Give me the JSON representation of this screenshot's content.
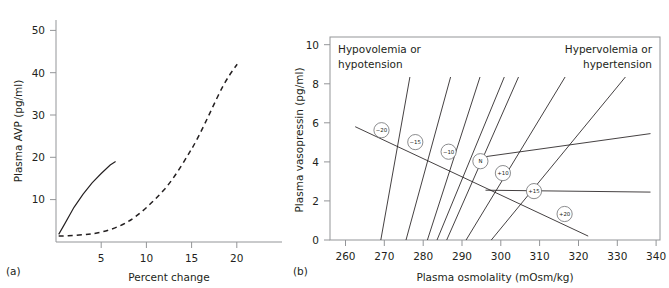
{
  "figure": {
    "panels": [
      {
        "id": "a",
        "label": "(a)",
        "axes": {
          "x": {
            "title": "Percent change",
            "ticks": [
              5,
              10,
              15,
              20
            ],
            "min": 0,
            "max": 25
          },
          "y": {
            "title": "Plasma AVP (pg/ml)",
            "ticks": [
              10,
              20,
              30,
              40,
              50
            ],
            "min": 0,
            "max": 55
          }
        }
      },
      {
        "id": "b",
        "label": "(b)",
        "axes": {
          "x": {
            "title": "Plasma osmolality (mOsm/kg)",
            "ticks": [
              260,
              270,
              280,
              290,
              300,
              310,
              320,
              330,
              340
            ],
            "min": 256,
            "max": 341
          },
          "y": {
            "title": "Plasma vasopressin (pg/ml)",
            "ticks": [
              0,
              2,
              4,
              6,
              8,
              10
            ],
            "min": 0,
            "max": 10.4
          }
        },
        "annotations": {
          "top_left": "Hypovolemia or hypotension",
          "top_right": "Hypervolemia or hypertension"
        }
      }
    ]
  },
  "chart_data": [
    {
      "type": "line",
      "panel": "a",
      "title": "",
      "xlabel": "Percent change",
      "ylabel": "Plasma AVP (pg/ml)",
      "xlim": [
        0,
        25
      ],
      "ylim": [
        0,
        55
      ],
      "xticks": [
        5,
        10,
        15,
        20
      ],
      "yticks": [
        10,
        20,
        30,
        40,
        50
      ],
      "grid": false,
      "legend": "none",
      "series": [
        {
          "name": "Osmolality (solid)",
          "style": "solid",
          "x": [
            0.3,
            1.0,
            2.0,
            3.0,
            4.0,
            5.0,
            6.0,
            6.6
          ],
          "y": [
            1.8,
            4.4,
            8.2,
            11.3,
            14.0,
            16.2,
            18.2,
            19.0
          ]
        },
        {
          "name": "Volume / pressure (dashed)",
          "style": "dashed",
          "x": [
            0.3,
            2.0,
            4.0,
            6.0,
            8.0,
            10.0,
            12.0,
            14.0,
            15.0,
            16.0,
            17.0,
            18.0,
            19.0,
            19.5
          ],
          "y": [
            1.4,
            1.5,
            1.8,
            2.3,
            3.2,
            4.6,
            6.5,
            9.5,
            11.8,
            14.8,
            19.5,
            26.5,
            36.0,
            42.0
          ]
        }
      ]
    },
    {
      "type": "line",
      "panel": "b",
      "title": "",
      "xlabel": "Plasma osmolality (mOsm/kg)",
      "ylabel": "Plasma vasopressin (pg/ml)",
      "xlim": [
        256,
        341
      ],
      "ylim": [
        0,
        10.4
      ],
      "xticks": [
        260,
        270,
        280,
        290,
        300,
        310,
        320,
        330,
        340
      ],
      "yticks": [
        0,
        2,
        4,
        6,
        8,
        10
      ],
      "grid": false,
      "legend": "none",
      "annotations": [
        {
          "text": "Hypovolemia or hypotension",
          "x": 262,
          "y": 9.7,
          "align": "left"
        },
        {
          "text": "Hypervolemia or hypertension",
          "x": 339,
          "y": 9.7,
          "align": "right"
        }
      ],
      "nodes": [
        {
          "label": "−20",
          "x": 269.3,
          "y": 5.62
        },
        {
          "label": "−15",
          "x": 278.0,
          "y": 5.01
        },
        {
          "label": "−10",
          "x": 286.6,
          "y": 4.52
        },
        {
          "label": "N",
          "x": 294.8,
          "y": 4.03
        },
        {
          "label": "+10",
          "x": 300.6,
          "y": 3.42
        },
        {
          "label": "+15",
          "x": 308.6,
          "y": 2.5
        },
        {
          "label": "+20",
          "x": 316.5,
          "y": 1.33
        }
      ],
      "isopleths": [
        {
          "name": "-20",
          "x": [
            265.0,
            272.5
          ],
          "y": [
            0.0,
            8.35
          ]
        },
        {
          "name": "-15",
          "x": [
            271.5,
            283.0
          ],
          "y": [
            0.0,
            8.35
          ]
        },
        {
          "name": "-10",
          "x": [
            277.0,
            290.5
          ],
          "y": [
            0.0,
            8.35
          ]
        },
        {
          "name": "N",
          "x": [
            279.5,
            296.8
          ],
          "y": [
            0.0,
            8.35
          ]
        },
        {
          "name": "+10",
          "x": [
            282.0,
            300.5
          ],
          "y": [
            0.0,
            8.35
          ]
        },
        {
          "name": "+15",
          "x": [
            287.0,
            312.5
          ],
          "y": [
            0.0,
            8.35
          ]
        },
        {
          "name": "+20",
          "x": [
            293.5,
            328.0
          ],
          "y": [
            0.0,
            8.35
          ]
        }
      ],
      "response_lines": [
        {
          "name": "upper-left to +20 node",
          "x": [
            262.5,
            322.5
          ],
          "y": [
            5.8,
            0.2
          ]
        },
        {
          "name": "mid response",
          "x": [
            293.5,
            338.5
          ],
          "y": [
            4.2,
            5.45
          ]
        },
        {
          "name": "lower response",
          "x": [
            296.0,
            338.5
          ],
          "y": [
            2.55,
            2.45
          ]
        }
      ]
    }
  ]
}
